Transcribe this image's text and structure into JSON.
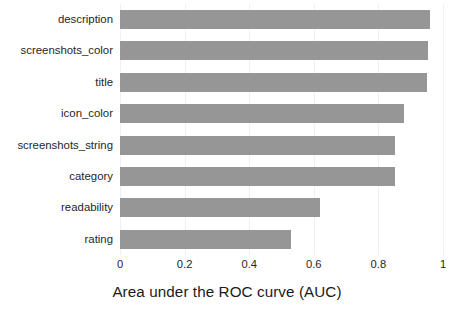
{
  "chart_data": {
    "type": "bar",
    "orientation": "horizontal",
    "title": "",
    "xlabel": "Area under the ROC curve (AUC)",
    "ylabel": "",
    "xlim": [
      0,
      1
    ],
    "xticks": [
      "0",
      "0.2",
      "0.4",
      "0.6",
      "0.8",
      "1"
    ],
    "xtick_values": [
      0,
      0.2,
      0.4,
      0.6,
      0.8,
      1
    ],
    "grid": true,
    "legend": false,
    "bar_color": "#969696",
    "categories": [
      "description",
      "screenshots_color",
      "title",
      "icon_color",
      "screenshots_string",
      "category",
      "readability",
      "rating"
    ],
    "values": [
      0.96,
      0.955,
      0.95,
      0.88,
      0.85,
      0.85,
      0.62,
      0.53
    ]
  }
}
